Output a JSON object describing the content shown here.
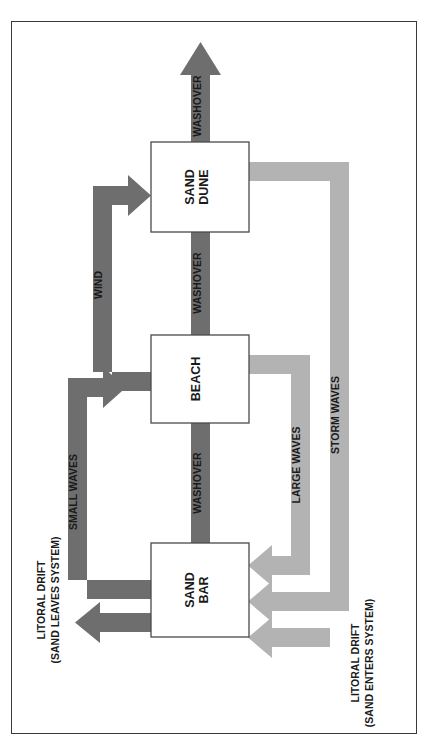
{
  "figure": {
    "type": "flow-diagram",
    "orientation": "rotated-90-ccw",
    "colors": {
      "dark_arrow": "#6e6e6e",
      "light_arrow": "#b3b3b3",
      "box_fill": "#ffffff",
      "box_stroke": "#4a4a4a",
      "frame_stroke": "#3a3a3a",
      "text": "#1a1a1a"
    }
  },
  "nodes": [
    {
      "id": "sand-dune",
      "label_line1": "SAND",
      "label_line2": "DUNE"
    },
    {
      "id": "beach",
      "label_line1": "BEACH",
      "label_line2": ""
    },
    {
      "id": "sand-bar",
      "label_line1": "SAND",
      "label_line2": "BAR"
    }
  ],
  "flows": {
    "washover_out": "WASHOVER",
    "washover_dune_beach": "WASHOVER",
    "washover_beach_bar": "WASHOVER",
    "wind": "WIND",
    "small_waves": "SMALL WAVES",
    "large_waves": "LARGE WAVES",
    "storm_waves": "STORM WAVES"
  },
  "side_labels": {
    "left_line1": "LITORAL DRIFT",
    "left_line2": "(SAND LEAVES SYSTEM)",
    "right_line1": "LITORAL DRIFT",
    "right_line2": "(SAND ENTERS SYSTEM)"
  }
}
